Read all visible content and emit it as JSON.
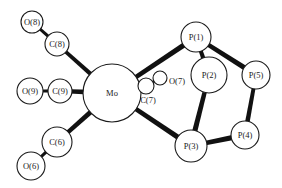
{
  "diagram": {
    "type": "molecular-structure",
    "colors": {
      "line": "#111111",
      "atom_fill": "#ffffff",
      "background": "#ffffff"
    },
    "atoms": [
      {
        "id": "O8",
        "label": "O(8)",
        "x": 32,
        "y": 22,
        "r": 11
      },
      {
        "id": "C8",
        "label": "C(8)",
        "x": 57,
        "y": 44,
        "r": 12
      },
      {
        "id": "O9",
        "label": "O(9)",
        "x": 30,
        "y": 91,
        "r": 13
      },
      {
        "id": "C9",
        "label": "C(9)",
        "x": 60,
        "y": 91,
        "r": 12
      },
      {
        "id": "Mo",
        "label": "Mo",
        "x": 112,
        "y": 93,
        "r": 29
      },
      {
        "id": "C7",
        "label": "C(7)",
        "x": 146,
        "y": 86,
        "r": 8
      },
      {
        "id": "O7",
        "label": "O(7)",
        "x": 160,
        "y": 78,
        "r": 7
      },
      {
        "id": "C6",
        "label": "C(6)",
        "x": 57,
        "y": 142,
        "r": 15
      },
      {
        "id": "O6",
        "label": "O(6)",
        "x": 31,
        "y": 166,
        "r": 14
      },
      {
        "id": "P1",
        "label": "P(1)",
        "x": 196,
        "y": 37,
        "r": 15
      },
      {
        "id": "P2",
        "label": "P(2)",
        "x": 209,
        "y": 75,
        "r": 18
      },
      {
        "id": "P5",
        "label": "P(5)",
        "x": 256,
        "y": 75,
        "r": 14
      },
      {
        "id": "P3",
        "label": "P(3)",
        "x": 191,
        "y": 146,
        "r": 16
      },
      {
        "id": "P4",
        "label": "P(4)",
        "x": 245,
        "y": 135,
        "r": 14
      }
    ],
    "bonds": [
      {
        "from": "O8",
        "to": "C8",
        "w": 3
      },
      {
        "from": "C8",
        "to": "Mo",
        "w": 4
      },
      {
        "from": "O9",
        "to": "C9",
        "w": 3
      },
      {
        "from": "C9",
        "to": "Mo",
        "w": 4.5
      },
      {
        "from": "C6",
        "to": "Mo",
        "w": 4.5
      },
      {
        "from": "O6",
        "to": "C6",
        "w": 3
      },
      {
        "from": "Mo",
        "to": "C7",
        "w": 3
      },
      {
        "from": "C7",
        "to": "O7",
        "w": 2.5
      },
      {
        "from": "Mo",
        "to": "P1",
        "w": 4.5
      },
      {
        "from": "Mo",
        "to": "P3",
        "w": 4.5
      },
      {
        "from": "P1",
        "to": "P2",
        "w": 4
      },
      {
        "from": "P1",
        "to": "P5",
        "w": 4.5
      },
      {
        "from": "P2",
        "to": "P3",
        "w": 4.5
      },
      {
        "from": "P5",
        "to": "P4",
        "w": 4
      },
      {
        "from": "P3",
        "to": "P4",
        "w": 4.5
      }
    ]
  }
}
